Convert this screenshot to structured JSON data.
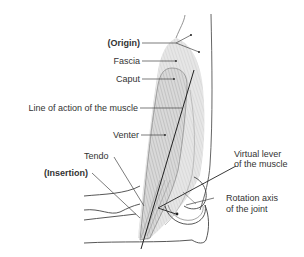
{
  "diagram": {
    "labels": {
      "origin": "(Origin)",
      "fascia": "Fascia",
      "caput": "Caput",
      "line_of_action": "Line of action of the muscle",
      "venter": "Venter",
      "tendo": "Tendo",
      "insertion": "(Insertion)",
      "virtual_lever_1": "Virtual lever",
      "virtual_lever_2": "of the muscle",
      "rotation_axis_1": "Rotation axis",
      "rotation_axis_2": "of the joint"
    },
    "colors": {
      "line": "#333333",
      "muscle_fill": "#d6d6d6",
      "muscle_stripe": "#9a9a9a",
      "fascia_fill": "#ececec",
      "outline": "#444444"
    }
  }
}
